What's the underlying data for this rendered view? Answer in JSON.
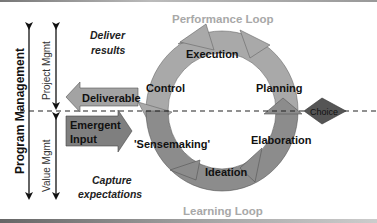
{
  "diagram": {
    "left_axis": {
      "program": "Program Management",
      "project": "Project Mgmt",
      "value": "Value Mgmt"
    },
    "top_note": {
      "line1": "Deliver",
      "line2": "results"
    },
    "bottom_note": {
      "line1": "Capture",
      "line2": "expectations"
    },
    "arrows": {
      "deliverable": "Deliverable",
      "emergent_line1": "Emergent",
      "emergent_line2": "Input"
    },
    "loops": {
      "performance": "Performance Loop",
      "learning": "Learning Loop"
    },
    "stages": {
      "execution": "Execution",
      "planning": "Planning",
      "control": "Control",
      "elaboration": "Elaboration",
      "sensemaking": "'Sensemaking'",
      "ideation": "Ideation"
    },
    "decision": "Choice",
    "colors": {
      "upper_ring": "#a9a9a9",
      "lower_ring": "#8c8c8c",
      "deliverable_arrow": "#a3a3a3",
      "emergent_arrow": "#7f7f7f",
      "choice_diamond": "#555555",
      "loop_label": "#a8a8a8"
    }
  }
}
